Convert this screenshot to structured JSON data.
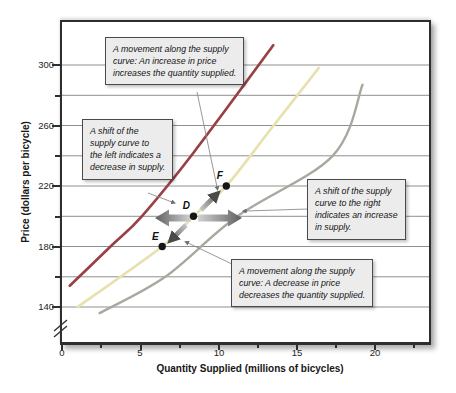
{
  "colors": {
    "plot_border": "#2e2e2e",
    "grid": "#828282",
    "curve_shift_left": "#9a4146",
    "curve_original": "#e7e2ad",
    "curve_shift_right": "#a9a89e",
    "point_dot": "#161616",
    "arrow_light": "#d2d2d2",
    "arrow_dark": "#5f5f5f",
    "callout_bg": "#ececec",
    "callout_border": "#4a4a4a",
    "leader": "#8d8d8d"
  },
  "chart_data": {
    "type": "line",
    "title": "",
    "xlabel": "Quantity Supplied (millions of bicycles)",
    "ylabel": "Price (dollars per bicycle)",
    "xlim": [
      0,
      23.4
    ],
    "ylim_visible": [
      140,
      300
    ],
    "grid": "horizontal",
    "axis_break_on_y": true,
    "x_ticks_major": [
      0,
      5,
      10,
      15,
      20
    ],
    "x_ticks_minor": [
      2.5,
      7.5,
      12.5,
      17.5,
      22.5
    ],
    "y_ticks_major": [
      300,
      260,
      220,
      180,
      140
    ],
    "y_ticks_minor": [
      280,
      240,
      200,
      160
    ],
    "gridline_prices": [
      140,
      160,
      180,
      200,
      220,
      240,
      260,
      280,
      300
    ],
    "series": [
      {
        "name": "supply-curve-shifted-left",
        "color": "#9a4146",
        "width": 2.7,
        "points": [
          [
            0.5,
            154
          ],
          [
            3.1,
            180
          ],
          [
            5.1,
            200
          ],
          [
            8.4,
            242
          ],
          [
            13.5,
            313
          ]
        ]
      },
      {
        "name": "supply-curve-original",
        "color": "#e7e2ad",
        "width": 2.7,
        "points": [
          [
            1.0,
            140
          ],
          [
            6.4,
            180
          ],
          [
            8.4,
            200
          ],
          [
            10.5,
            220
          ],
          [
            13.3,
            257
          ],
          [
            16.4,
            298
          ]
        ]
      },
      {
        "name": "supply-curve-shifted-right",
        "color": "#a9a89e",
        "width": 2.4,
        "points": [
          [
            2.4,
            136
          ],
          [
            6.6,
            160
          ],
          [
            11.2,
            200
          ],
          [
            17.3,
            240
          ],
          [
            19.2,
            287
          ]
        ]
      }
    ],
    "labeled_points": [
      {
        "label": "D",
        "q": 8.4,
        "price": 200
      },
      {
        "label": "E",
        "q": 6.4,
        "price": 180
      },
      {
        "label": "F",
        "q": 10.5,
        "price": 220
      }
    ],
    "annotations": [
      {
        "id": "movement-increase",
        "text": "A movement along the supply\ncurve: An increase in price\nincreases the quantity supplied."
      },
      {
        "id": "shift-left",
        "text": "A shift of the\nsupply curve to\nthe left indicates a\ndecrease in supply."
      },
      {
        "id": "shift-right",
        "text": "A shift of the supply\ncurve to the right\nindicates an increase\nin supply."
      },
      {
        "id": "movement-decrease",
        "text": "A movement along the supply\ncurve: A decrease in price\ndecreases the quantity supplied."
      }
    ],
    "arrows": [
      {
        "id": "shift-left-arrow",
        "meaning": "supply curve shifts left (decrease in supply)"
      },
      {
        "id": "shift-right-arrow",
        "meaning": "supply curve shifts right (increase in supply)"
      },
      {
        "id": "movement-up-arrow",
        "meaning": "movement along curve from D up to F"
      },
      {
        "id": "movement-down-arrow",
        "meaning": "movement along curve from D down to E"
      }
    ]
  }
}
